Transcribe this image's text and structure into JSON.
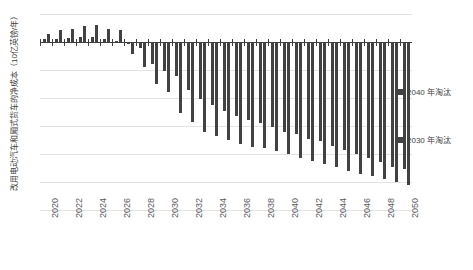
{
  "chart_data": {
    "type": "bar",
    "title": "",
    "subtitle": "",
    "xlabel": "",
    "ylabel": "改用电动汽车和厢式货车的净成本（10亿英镑/年）",
    "ylim": [
      -12,
      2
    ],
    "yticks": [
      2,
      0,
      -2,
      -4,
      -6,
      -8,
      -10,
      -12
    ],
    "ytick_labels": [
      "2",
      "0",
      "-2",
      "-4",
      "-6",
      "-8",
      "-10",
      "-12"
    ],
    "grid": true,
    "legend_position": "right",
    "x": [
      2020,
      2021,
      2022,
      2023,
      2024,
      2025,
      2026,
      2027,
      2028,
      2029,
      2030,
      2031,
      2032,
      2033,
      2034,
      2035,
      2036,
      2037,
      2038,
      2039,
      2040,
      2041,
      2042,
      2043,
      2044,
      2045,
      2046,
      2047,
      2048,
      2049,
      2050
    ],
    "xtick_labels": [
      "2020",
      "2022",
      "2024",
      "2026",
      "2028",
      "2030",
      "2032",
      "2034",
      "2036",
      "2038",
      "2040",
      "2042",
      "2044",
      "2046",
      "2048",
      "2050"
    ],
    "xtick_values": [
      2020,
      2022,
      2024,
      2026,
      2028,
      2030,
      2032,
      2034,
      2036,
      2038,
      2040,
      2042,
      2044,
      2046,
      2048,
      2050
    ],
    "series": [
      {
        "name": "2030 年淘汰",
        "color": "#424242",
        "values": [
          0.55,
          0.85,
          0.95,
          1.15,
          1.2,
          0.95,
          0.85,
          -0.85,
          -1.75,
          -3.0,
          -3.6,
          -5.1,
          -5.7,
          -6.4,
          -6.7,
          -7.0,
          -7.3,
          -7.5,
          -7.6,
          -7.8,
          -8.0,
          -8.3,
          -8.5,
          -8.7,
          -8.9,
          -9.2,
          -9.4,
          -9.6,
          -9.8,
          -10.0,
          -10.2
        ]
      },
      {
        "name": "2040 年淘汰",
        "color": "#424242",
        "values": [
          0.2,
          0.25,
          0.3,
          0.35,
          0.35,
          0.2,
          0.1,
          -0.15,
          -0.4,
          -1.6,
          -2.1,
          -2.4,
          -3.4,
          -4.1,
          -4.5,
          -4.9,
          -5.3,
          -5.6,
          -5.8,
          -6.1,
          -6.4,
          -6.6,
          -6.9,
          -7.1,
          -7.4,
          -7.7,
          -8.0,
          -8.3,
          -8.6,
          -8.9,
          -9.1
        ]
      }
    ],
    "legend": [
      {
        "label": "2040 年淘汰",
        "color": "#424242"
      },
      {
        "label": "2030 年淘汰",
        "color": "#424242"
      }
    ]
  }
}
